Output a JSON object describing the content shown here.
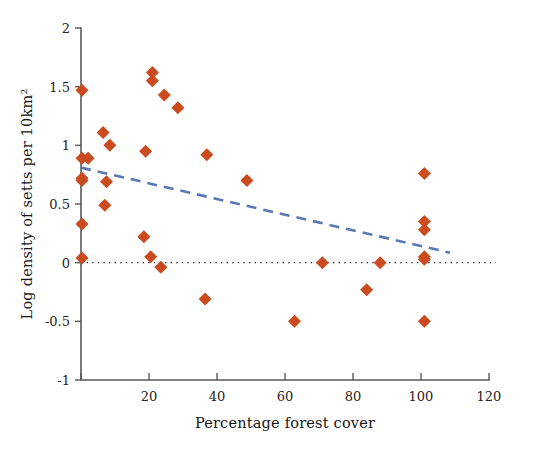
{
  "chart_data": {
    "type": "scatter",
    "title": "",
    "subtitle": "",
    "xlabel": "Percentage forest cover",
    "ylabel": "Log density of setts per 10km²",
    "xlim": [
      0,
      120
    ],
    "ylim": [
      -1,
      2
    ],
    "xticks": [
      0,
      20,
      40,
      60,
      80,
      100,
      120
    ],
    "xticklabels": [
      "",
      "20",
      "40",
      "60",
      "80",
      "100",
      "120"
    ],
    "yticks": [
      -1,
      -0.5,
      0,
      0.5,
      1,
      1.5,
      2
    ],
    "yticklabels": [
      "-1",
      "-0.5",
      "0",
      "0.5",
      "1",
      "1.5",
      "2"
    ],
    "grid": false,
    "legend": "none",
    "marker": {
      "shape": "diamond",
      "color": "#CC4B1E",
      "size": 13
    },
    "points": [
      {
        "x": 0.3,
        "y": 1.47
      },
      {
        "x": 0.3,
        "y": 0.89
      },
      {
        "x": 0.3,
        "y": 0.72
      },
      {
        "x": 0.3,
        "y": 0.7
      },
      {
        "x": 0.3,
        "y": 0.33
      },
      {
        "x": 0.3,
        "y": 0.04
      },
      {
        "x": 2.1,
        "y": 0.89
      },
      {
        "x": 6.5,
        "y": 1.11
      },
      {
        "x": 8.5,
        "y": 1.0
      },
      {
        "x": 7.5,
        "y": 0.69
      },
      {
        "x": 7.0,
        "y": 0.49
      },
      {
        "x": 19.0,
        "y": 0.95
      },
      {
        "x": 18.5,
        "y": 0.22
      },
      {
        "x": 20.5,
        "y": 0.05
      },
      {
        "x": 21.0,
        "y": 1.62
      },
      {
        "x": 21.0,
        "y": 1.55
      },
      {
        "x": 24.5,
        "y": 1.43
      },
      {
        "x": 23.5,
        "y": -0.04
      },
      {
        "x": 28.5,
        "y": 1.32
      },
      {
        "x": 37.0,
        "y": 0.92
      },
      {
        "x": 36.5,
        "y": -0.31
      },
      {
        "x": 48.8,
        "y": 0.7
      },
      {
        "x": 62.8,
        "y": -0.5
      },
      {
        "x": 71.0,
        "y": 0.0
      },
      {
        "x": 84.0,
        "y": -0.23
      },
      {
        "x": 88.0,
        "y": 0.0
      },
      {
        "x": 101.0,
        "y": 0.76
      },
      {
        "x": 101.0,
        "y": 0.35
      },
      {
        "x": 101.0,
        "y": 0.28
      },
      {
        "x": 101.0,
        "y": 0.05
      },
      {
        "x": 101.0,
        "y": 0.03
      },
      {
        "x": 101.0,
        "y": -0.5
      }
    ],
    "trend_line": {
      "style": "dashed",
      "color": "#5A78B4",
      "x_start": 0,
      "y_start": 0.81,
      "x_end": 108.5,
      "y_end": 0.085
    },
    "reference_line": {
      "style": "dotted",
      "color": "#2B2B2B",
      "orientation": "horizontal",
      "y": 0,
      "x_start": 0,
      "x_end": 122
    }
  },
  "colors": {
    "marker": "#CC4B1E",
    "trend": "#5A78B4",
    "axis": "#5A5A5A",
    "reference": "#2B2B2B",
    "background": "#FFFFFF"
  }
}
